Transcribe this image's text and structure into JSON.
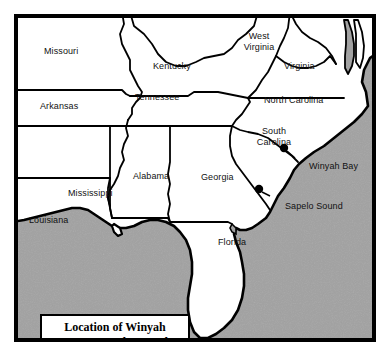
{
  "figure": {
    "name": "location-map",
    "kind": "reference locator map",
    "region": "Southeastern United States"
  },
  "title_box": {
    "line1": "Location of Winyah",
    "line2": "Bay & Sapelo Sound"
  },
  "colors": {
    "land": "#ffffff",
    "ocean": "#a2a2a2",
    "outline": "#000000",
    "frame": "#000000",
    "label_text": "#111111",
    "paper": "#ffffff"
  },
  "states": [
    {
      "name": "Missouri",
      "x": 40,
      "y": 42,
      "lines": [
        "Missouri"
      ]
    },
    {
      "name": "Kentucky",
      "x": 149,
      "y": 57,
      "lines": [
        "Kentucky"
      ]
    },
    {
      "name": "West Virginia",
      "x": 235,
      "y": 28,
      "lines": [
        "West",
        "Virginia"
      ],
      "multiline": true,
      "width": 40
    },
    {
      "name": "Virginia",
      "x": 282,
      "y": 57,
      "lines": [
        "Virginia"
      ]
    },
    {
      "name": "Arkansas",
      "x": 36,
      "y": 97,
      "lines": [
        "Arkansas"
      ]
    },
    {
      "name": "Tennessee",
      "x": 131,
      "y": 88,
      "lines": [
        "Tennessee"
      ]
    },
    {
      "name": "North Carolina",
      "x": 261,
      "y": 91,
      "lines": [
        "North Carolina"
      ]
    },
    {
      "name": "South Carolina",
      "x": 244,
      "y": 122,
      "lines": [
        "South",
        "Carolina"
      ],
      "multiline": true,
      "width": 50
    },
    {
      "name": "Mississippi",
      "x": 64,
      "y": 184,
      "lines": [
        "Mississippi"
      ]
    },
    {
      "name": "Alabama",
      "x": 129,
      "y": 167,
      "lines": [
        "Alabama"
      ]
    },
    {
      "name": "Georgia",
      "x": 197,
      "y": 168,
      "lines": [
        "Georgia"
      ]
    },
    {
      "name": "Louisiana",
      "x": 25,
      "y": 211,
      "lines": [
        "Louisiana"
      ]
    },
    {
      "name": "Florida",
      "x": 214,
      "y": 233,
      "lines": [
        "Florida"
      ]
    }
  ],
  "sites": [
    {
      "name": "Winyah Bay",
      "label": "Winyah Bay",
      "marker_x": 291,
      "marker_y": 157,
      "label_x": 305,
      "label_y": 163,
      "leader": {
        "x1": 297,
        "y1": 161,
        "x2": 303,
        "y2": 167
      }
    },
    {
      "name": "Sapelo Sound",
      "label": "Sapelo Sound",
      "marker_x": 268,
      "marker_y": 202,
      "label_x": 281,
      "label_y": 203,
      "leader": {
        "x1": 272,
        "y1": 205,
        "x2": 279,
        "y2": 208
      }
    }
  ]
}
